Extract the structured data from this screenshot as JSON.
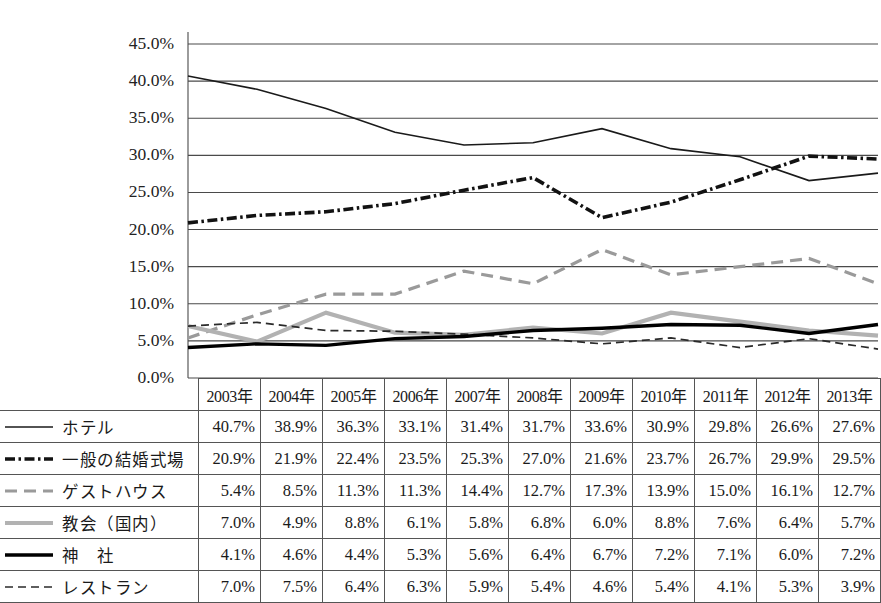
{
  "chart_data": {
    "type": "line",
    "title": "",
    "xlabel": "",
    "ylabel": "",
    "ylim": [
      0,
      45
    ],
    "ytick_step": 5,
    "grid": true,
    "legend_position": "table-left",
    "categories": [
      "2003年",
      "2004年",
      "2005年",
      "2006年",
      "2007年",
      "2008年",
      "2009年",
      "2010年",
      "2011年",
      "2012年",
      "2013年"
    ],
    "ytick_labels": [
      "45.0%",
      "40.0%",
      "35.0%",
      "30.0%",
      "25.0%",
      "20.0%",
      "15.0%",
      "10.0%",
      "5.0%",
      "0.0%"
    ],
    "ytick_values": [
      45,
      40,
      35,
      30,
      25,
      20,
      15,
      10,
      5,
      0
    ],
    "series": [
      {
        "name": "ホテル",
        "style": "solid-thin",
        "color": "#1a1a1a",
        "width": 1.6,
        "dash": "",
        "values": [
          40.7,
          38.9,
          36.3,
          33.1,
          31.4,
          31.7,
          33.6,
          30.9,
          29.8,
          26.6,
          27.6
        ],
        "labels": [
          "40.7%",
          "38.9%",
          "36.3%",
          "33.1%",
          "31.4%",
          "31.7%",
          "33.6%",
          "30.9%",
          "29.8%",
          "26.6%",
          "27.6%"
        ]
      },
      {
        "name": "一般の結婚式場",
        "style": "dash-dot-thick",
        "color": "#121212",
        "width": 3.6,
        "dash": "10,3.5,2.5,3.5",
        "values": [
          20.9,
          21.9,
          22.4,
          23.5,
          25.3,
          27.0,
          21.6,
          23.7,
          26.7,
          29.9,
          29.5
        ],
        "labels": [
          "20.9%",
          "21.9%",
          "22.4%",
          "23.5%",
          "25.3%",
          "27.0%",
          "21.6%",
          "23.7%",
          "26.7%",
          "29.9%",
          "29.5%"
        ]
      },
      {
        "name": "ゲストハウス",
        "style": "dashed-gray",
        "color": "#9a9a9a",
        "width": 3.2,
        "dash": "12,7",
        "values": [
          5.4,
          8.5,
          11.3,
          11.3,
          14.4,
          12.7,
          17.3,
          13.9,
          15.0,
          16.1,
          12.7
        ],
        "labels": [
          "5.4%",
          "8.5%",
          "11.3%",
          "11.3%",
          "14.4%",
          "12.7%",
          "17.3%",
          "13.9%",
          "15.0%",
          "16.1%",
          "12.7%"
        ]
      },
      {
        "name": "教会（国内）",
        "style": "solid-gray-thick",
        "color": "#b2b2b2",
        "width": 4.2,
        "dash": "",
        "values": [
          7.0,
          4.9,
          8.8,
          6.1,
          5.8,
          6.8,
          6.0,
          8.8,
          7.6,
          6.4,
          5.7
        ],
        "labels": [
          "7.0%",
          "4.9%",
          "8.8%",
          "6.1%",
          "5.8%",
          "6.8%",
          "6.0%",
          "8.8%",
          "7.6%",
          "6.4%",
          "5.7%"
        ]
      },
      {
        "name": "神　社",
        "style": "solid-black-thick",
        "color": "#000000",
        "width": 3.4,
        "dash": "",
        "values": [
          4.1,
          4.6,
          4.4,
          5.3,
          5.6,
          6.4,
          6.7,
          7.2,
          7.1,
          6.0,
          7.2
        ],
        "labels": [
          "4.1%",
          "4.6%",
          "4.4%",
          "5.3%",
          "5.6%",
          "6.4%",
          "6.7%",
          "7.2%",
          "7.1%",
          "6.0%",
          "7.2%"
        ]
      },
      {
        "name": "レストラン",
        "style": "dashed-thin",
        "color": "#2a2a2a",
        "width": 1.7,
        "dash": "8,5",
        "values": [
          7.0,
          7.5,
          6.4,
          6.3,
          5.9,
          5.4,
          4.6,
          5.4,
          4.1,
          5.3,
          3.9
        ],
        "labels": [
          "7.0%",
          "7.5%",
          "6.4%",
          "6.3%",
          "5.9%",
          "5.4%",
          "4.6%",
          "5.4%",
          "4.1%",
          "5.3%",
          "3.9%"
        ]
      }
    ]
  },
  "table": {
    "corner_label": "",
    "header_row": [
      "2003年",
      "2004年",
      "2005年",
      "2006年",
      "2007年",
      "2008年",
      "2009年",
      "2010年",
      "2011年",
      "2012年",
      "2013年"
    ],
    "rows": [
      {
        "label": "ホテル",
        "values": [
          "40.7%",
          "38.9%",
          "36.3%",
          "33.1%",
          "31.4%",
          "31.7%",
          "33.6%",
          "30.9%",
          "29.8%",
          "26.6%",
          "27.6%"
        ]
      },
      {
        "label": "一般の結婚式場",
        "values": [
          "20.9%",
          "21.9%",
          "22.4%",
          "23.5%",
          "25.3%",
          "27.0%",
          "21.6%",
          "23.7%",
          "26.7%",
          "29.9%",
          "29.5%"
        ]
      },
      {
        "label": "ゲストハウス",
        "values": [
          "5.4%",
          "8.5%",
          "11.3%",
          "11.3%",
          "14.4%",
          "12.7%",
          "17.3%",
          "13.9%",
          "15.0%",
          "16.1%",
          "12.7%"
        ]
      },
      {
        "label": "教会（国内）",
        "values": [
          "7.0%",
          "4.9%",
          "8.8%",
          "6.1%",
          "5.8%",
          "6.8%",
          "6.0%",
          "8.8%",
          "7.6%",
          "6.4%",
          "5.7%"
        ]
      },
      {
        "label": "神　社",
        "values": [
          "4.1%",
          "4.6%",
          "4.4%",
          "5.3%",
          "5.6%",
          "6.4%",
          "6.7%",
          "7.2%",
          "7.1%",
          "6.0%",
          "7.2%"
        ]
      },
      {
        "label": "レストラン",
        "values": [
          "7.0%",
          "7.5%",
          "6.4%",
          "6.3%",
          "5.9%",
          "5.4%",
          "4.6%",
          "5.4%",
          "4.1%",
          "5.3%",
          "3.9%"
        ]
      }
    ]
  },
  "colors": {
    "gridline": "#4a4a4a",
    "border": "#555555",
    "text": "#1a1a1a"
  }
}
